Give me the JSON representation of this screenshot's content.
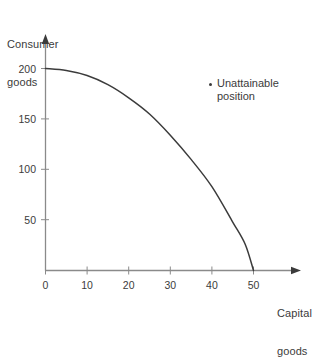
{
  "chart_data": {
    "type": "line",
    "title": "",
    "xlabel": "Capital goods",
    "ylabel": "Consumer goods",
    "ylabel_line1": "Consumer",
    "ylabel_line2": "goods",
    "xlabel_line1": "Capital",
    "xlabel_line2": "goods",
    "xlim": [
      0,
      50
    ],
    "ylim": [
      0,
      200
    ],
    "xticks": [
      0,
      10,
      20,
      30,
      40,
      50
    ],
    "xtick_labels": [
      "0",
      "10",
      "20",
      "30",
      "40",
      "50"
    ],
    "yticks": [
      50,
      100,
      150,
      200
    ],
    "ytick_labels": [
      "50",
      "100",
      "150",
      "200"
    ],
    "grid": false,
    "legend": null,
    "series": [
      {
        "name": "Production possibility frontier",
        "x": [
          0,
          5,
          10,
          15,
          20,
          25,
          30,
          35,
          40,
          45,
          48,
          50
        ],
        "y": [
          200,
          198,
          193,
          184,
          171,
          155,
          134,
          110,
          83,
          48,
          26,
          0
        ]
      }
    ],
    "annotations": [
      {
        "label_line1": "Unattainable",
        "label_line2": "position",
        "label": "Unattainable position",
        "marker": "dot",
        "x": 39,
        "y": 176
      }
    ],
    "axis_color": "#8a8a8a",
    "curve_color": "#3b3b3b",
    "text_color": "#3b3b3b",
    "background": "#ffffff"
  }
}
